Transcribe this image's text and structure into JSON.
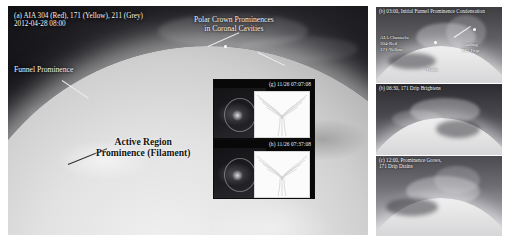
{
  "figure": {
    "width": 505,
    "height": 241,
    "background": "#ffffff"
  },
  "main_panel": {
    "panel_label": "(a)  AIA 304 (Red), 171 (Yellow), 211 (Grey)",
    "timestamp": "2012-04-28 08:00",
    "annotations": {
      "polar_crown": "Polar Crown Prominences\nin Coronal Cavities",
      "funnel": "Funnel Prominence",
      "active_region": "Active Region\nProminence (Filament)"
    },
    "colors": {
      "aia_304": "#cc2a1e",
      "aia_171": "#d8c23c",
      "aia_211": "#9a9a9a",
      "annotation_text": "#f4f4f4",
      "annotation_text_dark": "#141414"
    }
  },
  "insets": [
    {
      "id": "inset-g",
      "label": "(g) 11/26 07:07:08",
      "left_image": "coronal-cavity-image",
      "right_image": "magnetic-field-line-diagram"
    },
    {
      "id": "inset-h",
      "label": "(h) 11/26 07:37:08",
      "left_image": "coronal-cavity-image",
      "right_image": "magnetic-field-line-diagram"
    }
  ],
  "right_panels": [
    {
      "id": "rpanel-a",
      "title": "(b) 03:00, Initial Funnel Prominence Condensation",
      "annotations": {
        "channels": "AIA Channels:\n304-Red\n171-Yellow",
        "cooling": "Cooling\n171 Drip",
        "footer": "Trunk"
      }
    },
    {
      "id": "rpanel-b",
      "title": "(b) 06:30, 171 Drip Brightens",
      "annotations": {}
    },
    {
      "id": "rpanel-c",
      "title": "(c) 12:00, Prominence Grows,\n171 Drip Drains",
      "annotations": {}
    }
  ]
}
